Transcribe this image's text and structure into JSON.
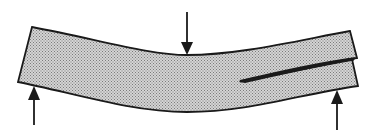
{
  "diagram": {
    "elements": [
      {
        "name": "beam",
        "description": "curved beam deflected downward at center"
      },
      {
        "name": "load-arrow",
        "description": "downward applied load at mid-span"
      },
      {
        "name": "left-support-arrow",
        "description": "upward support reaction at left end"
      },
      {
        "name": "right-support-arrow",
        "description": "upward support reaction at right end"
      },
      {
        "name": "delamination-crack",
        "description": "crack running from right end toward center, splitting beam into two layers"
      }
    ],
    "colors": {
      "stroke": "#1a1a1a",
      "fill": "#c8c8c8",
      "fill_dot": "#8a8a8a",
      "background": "#ffffff"
    }
  }
}
